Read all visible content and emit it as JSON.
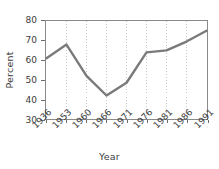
{
  "chart_data": {
    "type": "line",
    "title": "",
    "xlabel": "Year",
    "ylabel": "Percent",
    "categories": [
      "1936",
      "1953",
      "1960",
      "1966",
      "1971",
      "1976",
      "1981",
      "1986",
      "1991"
    ],
    "values": [
      61,
      68,
      52,
      42,
      48.5,
      64,
      65,
      69.5,
      75
    ],
    "series": [
      {
        "name": "Percent",
        "values": [
          61,
          68,
          52,
          42,
          48.5,
          64,
          65,
          69.5,
          75
        ],
        "color": "#7a7a7a"
      }
    ],
    "ylim": [
      30,
      80
    ],
    "yticks": [
      30,
      40,
      50,
      60,
      70,
      80
    ],
    "ytick_labels": [
      "30",
      "40",
      "50",
      "60",
      "70",
      "80"
    ],
    "xtick_labels": [
      "1936",
      "1953",
      "1960",
      "1966",
      "1971",
      "1976",
      "1981",
      "1986",
      "1991"
    ],
    "grid": "vertical-dotted",
    "grid_color": "#c8c8c8",
    "legend": "none",
    "frame_color": "#8a8a8a",
    "line_color": "#7a7a7a",
    "line_width": 2.4,
    "xtick_rotation": -45,
    "text_color": "#3b3b3b"
  }
}
